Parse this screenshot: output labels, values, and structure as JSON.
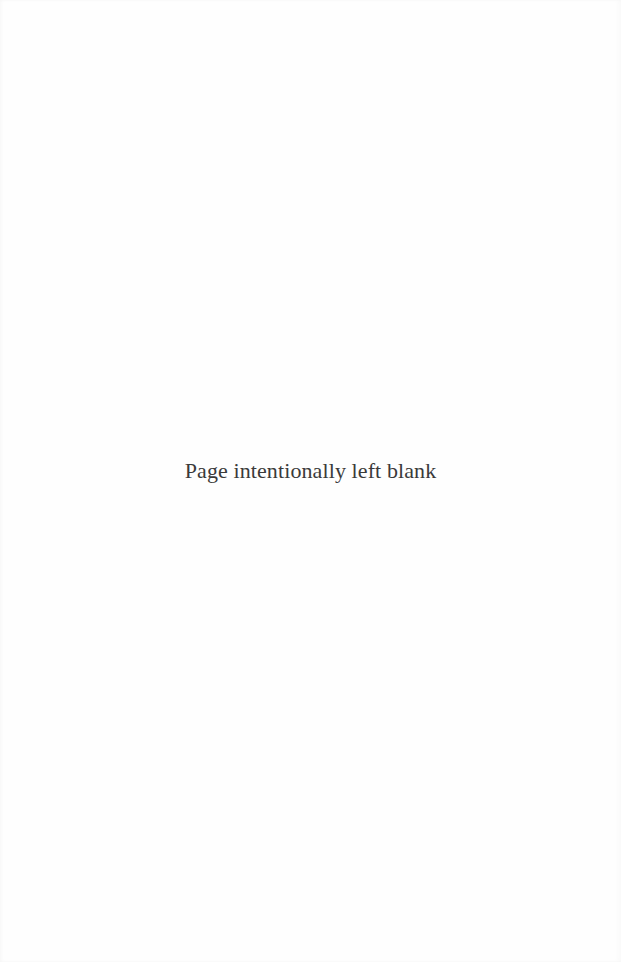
{
  "page": {
    "notice": "Page intentionally left blank",
    "background_color": "#fefefe",
    "text_color": "#3a3a3a"
  }
}
